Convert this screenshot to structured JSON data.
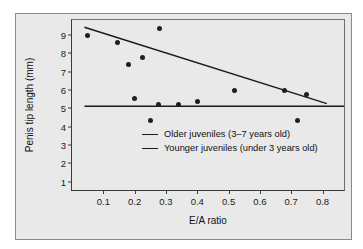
{
  "chart_data": {
    "type": "scatter",
    "title": "",
    "xlabel": "E/A ratio",
    "ylabel": "Penis tip length (mm)",
    "xlim": [
      0.0,
      0.875
    ],
    "ylim": [
      0.45,
      9.8
    ],
    "grid": false,
    "legend_position": "inside-lower-left",
    "xticks": [
      "0.1",
      "0.2",
      "0.3",
      "0.4",
      "0.5",
      "0.6",
      "0.7",
      "0.8"
    ],
    "xtick_values": [
      0.1,
      0.2,
      0.3,
      0.4,
      0.5,
      0.6,
      0.7,
      0.8
    ],
    "yticks": [
      "1",
      "2",
      "3",
      "4",
      "5",
      "6",
      "7",
      "8",
      "9"
    ],
    "ytick_values": [
      1,
      2,
      3,
      4,
      5,
      6,
      7,
      8,
      9
    ],
    "points": [
      {
        "x": 0.05,
        "y": 8.95
      },
      {
        "x": 0.145,
        "y": 8.55
      },
      {
        "x": 0.18,
        "y": 7.4
      },
      {
        "x": 0.2,
        "y": 5.55
      },
      {
        "x": 0.225,
        "y": 7.75
      },
      {
        "x": 0.25,
        "y": 4.35
      },
      {
        "x": 0.275,
        "y": 5.2
      },
      {
        "x": 0.28,
        "y": 9.35
      },
      {
        "x": 0.34,
        "y": 5.2
      },
      {
        "x": 0.4,
        "y": 5.35
      },
      {
        "x": 0.52,
        "y": 5.95
      },
      {
        "x": 0.68,
        "y": 5.95
      },
      {
        "x": 0.72,
        "y": 4.35
      },
      {
        "x": 0.75,
        "y": 5.75
      }
    ],
    "series": [
      {
        "name": "Older juveniles (3–7 years old)",
        "type": "line",
        "color": "#1b1b1b",
        "x": [
          0.04,
          0.82
        ],
        "y": [
          9.4,
          5.2
        ]
      },
      {
        "name": "Younger juveniles (under 3 years old)",
        "type": "line",
        "color": "#1b1b1b",
        "x": [
          0.04,
          0.875
        ],
        "y": [
          5.05,
          5.05
        ]
      }
    ]
  },
  "legend": {
    "items": [
      {
        "label": "Older juveniles (3–7 years old)"
      },
      {
        "label": "Younger juveniles (under 3 years old)"
      }
    ]
  },
  "colors": {
    "figure_background": "#e9e9e9",
    "axis": "#3a3a3a",
    "marker": "#1f1f1f",
    "line": "#1b1b1b"
  }
}
